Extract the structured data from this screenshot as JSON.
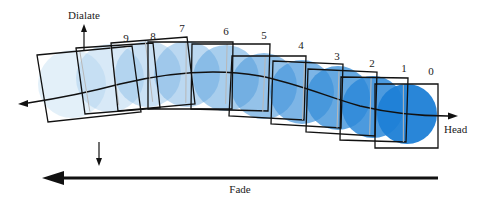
{
  "diagram": {
    "labels": {
      "dilate": "Dialate",
      "head": "Head",
      "fade": "Fade"
    },
    "frames": [
      {
        "index": "0",
        "label_pos": [
          431,
          75
        ],
        "box": [
          [
            375,
            84
          ],
          [
            438,
            84
          ],
          [
            438,
            148
          ],
          [
            375,
            148
          ]
        ],
        "inner": [
          [
            375,
            84
          ],
          [
            404,
            84
          ],
          [
            404,
            142
          ],
          [
            375,
            142
          ]
        ],
        "circle": [
          407,
          114,
          30
        ],
        "color": "#1d7fd6",
        "opacity": 0.95
      },
      {
        "index": "1",
        "label_pos": [
          404,
          72
        ],
        "box": [
          [
            341,
            77
          ],
          [
            408,
            78
          ],
          [
            406,
            142
          ],
          [
            340,
            140
          ]
        ],
        "circle": [
          373,
          107,
          31
        ],
        "color": "#2d88d8",
        "opacity": 0.85
      },
      {
        "index": "2",
        "label_pos": [
          372,
          67
        ],
        "box": [
          [
            308,
            69
          ],
          [
            377,
            72
          ],
          [
            375,
            136
          ],
          [
            306,
            132
          ]
        ],
        "circle": [
          338,
          98,
          32
        ],
        "color": "#3a8fd9",
        "opacity": 0.78
      },
      {
        "index": "3",
        "label_pos": [
          337,
          60
        ],
        "box": [
          [
            273,
            61
          ],
          [
            343,
            64
          ],
          [
            341,
            128
          ],
          [
            271,
            124
          ]
        ],
        "circle": [
          302,
          92,
          32
        ],
        "color": "#4696db",
        "opacity": 0.7
      },
      {
        "index": "4",
        "label_pos": [
          301,
          49
        ],
        "box": [
          [
            232,
            56
          ],
          [
            306,
            56
          ],
          [
            304,
            120
          ],
          [
            229,
            116
          ]
        ],
        "circle": [
          264,
          86,
          33
        ],
        "color": "#539ddc",
        "opacity": 0.62
      },
      {
        "index": "5",
        "label_pos": [
          264,
          39
        ],
        "box": [
          [
            192,
            44
          ],
          [
            270,
            44
          ],
          [
            268,
            111
          ],
          [
            191,
            109
          ]
        ],
        "circle": [
          226,
          78,
          33
        ],
        "color": "#61a5de",
        "opacity": 0.55
      },
      {
        "index": "6",
        "label_pos": [
          226,
          35
        ],
        "box": [
          [
            148,
            42
          ],
          [
            233,
            42
          ],
          [
            232,
            109
          ],
          [
            148,
            109
          ]
        ],
        "circle": [
          187,
          74,
          33
        ],
        "color": "#70aee1",
        "opacity": 0.48
      },
      {
        "index": "7",
        "label_pos": [
          182,
          32
        ],
        "box": [
          [
            111,
            43
          ],
          [
            187,
            37
          ],
          [
            195,
            104
          ],
          [
            118,
            111
          ]
        ],
        "circle": [
          148,
          74,
          33
        ],
        "color": "#80b8e4",
        "opacity": 0.42
      },
      {
        "index": "8",
        "label_pos": [
          153,
          40
        ],
        "box": [
          [
            76,
            48
          ],
          [
            153,
            43
          ],
          [
            160,
            108
          ],
          [
            85,
            114
          ]
        ],
        "circle": [
          110,
          78,
          34
        ],
        "color": "#92c3e8",
        "opacity": 0.36
      },
      {
        "index": "9",
        "label_pos": [
          126,
          42
        ],
        "box": [
          [
            37,
            55
          ],
          [
            132,
            46
          ],
          [
            141,
            112
          ],
          [
            48,
            122
          ]
        ],
        "circle": [
          72,
          84,
          34
        ],
        "color": "#a8d0ec",
        "opacity": 0.32
      }
    ],
    "colors": {
      "stroke": "#111111",
      "ghost_stroke": "#b8b8b8",
      "head_blue": "#1d7fd6",
      "tail_blue": "#cfe4f4"
    }
  }
}
